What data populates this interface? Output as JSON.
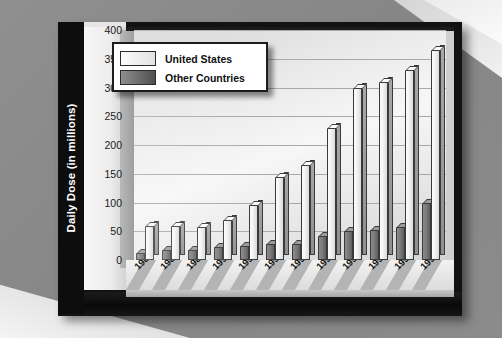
{
  "chart_data": {
    "type": "bar",
    "title": "",
    "xlabel": "",
    "ylabel": "Daily Dose (in millions)",
    "ylim": [
      0,
      400
    ],
    "yticks": [
      0,
      50,
      100,
      150,
      200,
      250,
      300,
      350,
      400
    ],
    "grid": true,
    "legend_position": "top-left-inside",
    "categories": [
      "1987",
      "1988",
      "1989",
      "1990",
      "1991",
      "1992",
      "1993",
      "1994",
      "1995",
      "1996",
      "1997",
      "1998"
    ],
    "series": [
      {
        "name": "United States",
        "values": [
          60,
          60,
          58,
          70,
          95,
          145,
          165,
          230,
          300,
          310,
          330,
          365
        ]
      },
      {
        "name": "Other Countries",
        "values": [
          12,
          18,
          18,
          22,
          25,
          28,
          28,
          42,
          50,
          52,
          58,
          100
        ]
      }
    ]
  },
  "axis": {
    "y_title": "Daily Dose (in millions)",
    "y_ticks": [
      "400",
      "350",
      "300",
      "250",
      "200",
      "150",
      "100",
      "50",
      "0"
    ]
  },
  "legend": {
    "entries": [
      {
        "label": "United States",
        "swatch": "light-gradient-swatch"
      },
      {
        "label": "Other Countries",
        "swatch": "dark-gradient-swatch"
      }
    ]
  }
}
